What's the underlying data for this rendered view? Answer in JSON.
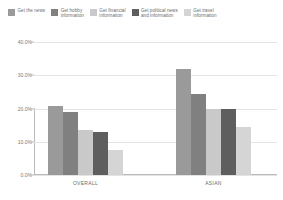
{
  "chart_data": {
    "type": "bar",
    "title": "",
    "xlabel": "",
    "ylabel": "",
    "categories": [
      "OVERALL",
      "ASIAN"
    ],
    "ylim": [
      0,
      40
    ],
    "ytick_labels": [
      "40.0%",
      "30.0%",
      "20.0%",
      "10.0%",
      "0.0%"
    ],
    "ytick_values": [
      40,
      30,
      20,
      10,
      0
    ],
    "y_unit": "%",
    "grid": true,
    "legend_position": "top",
    "series": [
      {
        "name": "Get the news",
        "color": "#9a9a9a",
        "values": [
          20.8,
          32.0
        ]
      },
      {
        "name": "Get hobby\ninformation",
        "color": "#808080",
        "values": [
          19.0,
          24.5
        ]
      },
      {
        "name": "Get financial\ninformation",
        "color": "#c9c9c9",
        "values": [
          13.5,
          20.0
        ]
      },
      {
        "name": "Get political news\nand information",
        "color": "#5e5e5e",
        "values": [
          13.0,
          20.0
        ]
      },
      {
        "name": "Get travel\ninformation",
        "color": "#d5d5d5",
        "values": [
          7.5,
          14.5
        ]
      }
    ]
  }
}
